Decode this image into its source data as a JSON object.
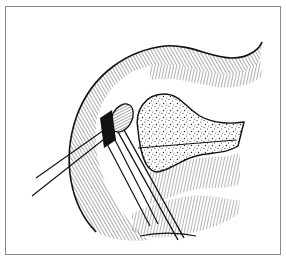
{
  "figure": {
    "style": "black-and-white line drawing with hatching and stippling",
    "colors": {
      "ink": "#111111",
      "frame": "#8a8a8a",
      "background": "#ffffff"
    },
    "elements": [
      "outer-tissue-fold",
      "upper-tissue-edge",
      "stippled-mass",
      "grasped-nodule",
      "forceps",
      "suture-threads",
      "retracted-flap"
    ]
  }
}
